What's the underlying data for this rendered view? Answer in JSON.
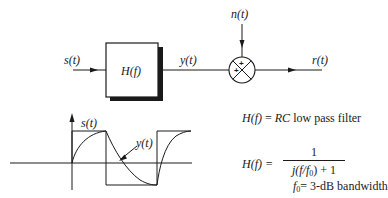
{
  "block_diagram": {
    "input_label": "s(t)",
    "filter_label": "H(f)",
    "filter_output_label": "y(t)",
    "noise_label": "n(t)",
    "output_label": "r(t)",
    "summer_signs": [
      "+",
      "+"
    ]
  },
  "waveform": {
    "input_label": "s(t)",
    "output_label": "y(t)"
  },
  "equations": {
    "line1_lhs": "H(f)",
    "line1_eq": " = ",
    "line1_rhs_italic": "RC",
    "line1_rhs_text": " low pass filter",
    "line2_lhs": "H(f) = ",
    "line2_numerator": "1",
    "line2_denominator_pre": "j(f/f",
    "line2_denominator_sub": "0",
    "line2_denominator_post": ") + 1",
    "line3_var": "f",
    "line3_sub": "0",
    "line3_text": "= 3-dB bandwidth"
  },
  "colors": {
    "ink": "#1a1a1a",
    "background": "#ffffff"
  }
}
